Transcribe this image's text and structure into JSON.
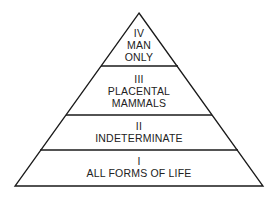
{
  "diagram": {
    "type": "pyramid",
    "tiers": [
      {
        "numeral": "IV",
        "lines": [
          "MAN",
          "ONLY"
        ]
      },
      {
        "numeral": "III",
        "lines": [
          "PLACENTAL",
          "MAMMALS"
        ]
      },
      {
        "numeral": "II",
        "lines": [
          "INDETERMINATE"
        ]
      },
      {
        "numeral": "I",
        "lines": [
          "ALL FORMS OF LIFE"
        ]
      }
    ],
    "stroke_color": "#1a1a1a",
    "background": "#ffffff"
  }
}
